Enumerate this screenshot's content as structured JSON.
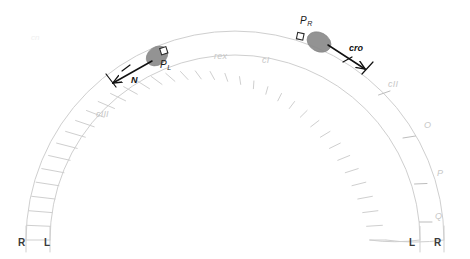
{
  "figure": {
    "type": "lambda-phage-genome-arc-map",
    "background_color": "#ffffff",
    "ladder_color": "#cfcfcf",
    "gene_label_color": "#c8c8c8",
    "promoter_label_color": "#1a1a1a",
    "protein_color": "#8a8a8a",
    "arrow_color": "#111111"
  },
  "genes": [
    {
      "id": "cIII",
      "label": "cIII",
      "x": 96,
      "y": 110
    },
    {
      "id": "rex",
      "label": "rex",
      "x": 214,
      "y": 52
    },
    {
      "id": "cI",
      "label": "cI",
      "x": 262,
      "y": 56
    },
    {
      "id": "cII",
      "label": "cII",
      "x": 388,
      "y": 80
    },
    {
      "id": "O",
      "label": "O",
      "x": 424,
      "y": 121
    },
    {
      "id": "P",
      "label": "P",
      "x": 437,
      "y": 169
    },
    {
      "id": "Q",
      "label": "Q",
      "x": 435,
      "y": 212
    }
  ],
  "promoters": [
    {
      "id": "PL",
      "label": "P",
      "subscript": "L",
      "x": 160,
      "y": 60,
      "marker_x": 152,
      "marker_y": 52
    },
    {
      "id": "PR",
      "label": "P",
      "subscript": "R",
      "x": 300,
      "y": 16,
      "marker_x": 299,
      "marker_y": 33
    }
  ],
  "proteins": [
    {
      "id": "rna-polymerase-left",
      "cx": 157,
      "cy": 56,
      "rx": 11,
      "ry": 9,
      "rotation": -35
    },
    {
      "id": "rna-polymerase-right",
      "cx": 319,
      "cy": 42,
      "rx": 12,
      "ry": 9,
      "rotation": 30
    }
  ],
  "transcripts": [
    {
      "id": "N",
      "label": "N",
      "x": 131,
      "y": 76,
      "direction": "leftward"
    },
    {
      "id": "cro",
      "label": "cro",
      "x": 349,
      "y": 44,
      "direction": "rightward"
    }
  ],
  "strand_ends": {
    "left": [
      {
        "id": "left-outer",
        "label": "R",
        "x": 18,
        "y": 238
      },
      {
        "id": "left-inner",
        "label": "L",
        "x": 44,
        "y": 238
      }
    ],
    "right": [
      {
        "id": "right-inner",
        "label": "L",
        "x": 409,
        "y": 238
      },
      {
        "id": "right-outer",
        "label": "R",
        "x": 434,
        "y": 238
      }
    ]
  },
  "artifacts": [
    {
      "id": "corner-smudge",
      "label": "cn",
      "x": 31,
      "y": 33
    }
  ]
}
